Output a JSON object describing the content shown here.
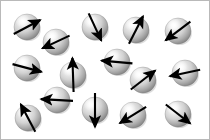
{
  "figure": {
    "type": "diagram",
    "width": 210,
    "height": 140,
    "background_color": "#ffffff",
    "border_color": "#b9b9b9",
    "sphere": {
      "fill_light": "#f2f2f2",
      "fill_mid": "#c9c9c9",
      "fill_dark": "#8d8d8d",
      "edge_color": "#6e6e6e",
      "highlight_color": "#ffffff",
      "shadow_color": "#9a9a9a",
      "default_radius": 13
    },
    "arrow": {
      "color": "#000000",
      "stroke_width": 2.1,
      "head_length": 6.5,
      "head_width": 5.2,
      "default_length": 30
    },
    "legend_text": "",
    "caption": ""
  },
  "chart_data": {
    "type": "scatter",
    "xlabel": "",
    "ylabel": "",
    "xlim": [
      0,
      210
    ],
    "ylim": [
      0,
      140
    ],
    "grid": false,
    "legend": "none",
    "units": "pixels",
    "note": "Each particle is a shaded sphere with a black vector arrow through its center indicating spin direction. Angle is measured in degrees counter-clockwise from the +x axis.",
    "particles": [
      {
        "id": "spin-1",
        "label": "sphere-1",
        "cx": 27,
        "cy": 27,
        "r": 13,
        "angle_deg": 28,
        "length": 30
      },
      {
        "id": "spin-2",
        "label": "sphere-2",
        "cx": 56,
        "cy": 42,
        "r": 13,
        "angle_deg": 205,
        "length": 30
      },
      {
        "id": "spin-3",
        "label": "sphere-3",
        "cx": 95,
        "cy": 27,
        "r": 13,
        "angle_deg": 295,
        "length": 30
      },
      {
        "id": "spin-4",
        "label": "sphere-4",
        "cx": 136,
        "cy": 30,
        "r": 13,
        "angle_deg": 63,
        "length": 31
      },
      {
        "id": "spin-5",
        "label": "sphere-5",
        "cx": 178,
        "cy": 31,
        "r": 13,
        "angle_deg": 217,
        "length": 31
      },
      {
        "id": "spin-6",
        "label": "sphere-6",
        "cx": 27,
        "cy": 68,
        "r": 13,
        "angle_deg": 345,
        "length": 30
      },
      {
        "id": "spin-7",
        "label": "sphere-7",
        "cx": 73,
        "cy": 75,
        "r": 13,
        "angle_deg": 92,
        "length": 34
      },
      {
        "id": "spin-8",
        "label": "sphere-8",
        "cx": 117,
        "cy": 62,
        "r": 13,
        "angle_deg": 175,
        "length": 31
      },
      {
        "id": "spin-9",
        "label": "sphere-9",
        "cx": 143,
        "cy": 80,
        "r": 13,
        "angle_deg": 38,
        "length": 31
      },
      {
        "id": "spin-10",
        "label": "sphere-10",
        "cx": 185,
        "cy": 73,
        "r": 13,
        "angle_deg": 192,
        "length": 31
      },
      {
        "id": "spin-11",
        "label": "sphere-11",
        "cx": 57,
        "cy": 100,
        "r": 13,
        "angle_deg": 177,
        "length": 32
      },
      {
        "id": "spin-12",
        "label": "sphere-12",
        "cx": 28,
        "cy": 118,
        "r": 13,
        "angle_deg": 118,
        "length": 31
      },
      {
        "id": "spin-13",
        "label": "sphere-13",
        "cx": 95,
        "cy": 110,
        "r": 13,
        "angle_deg": 270,
        "length": 34
      },
      {
        "id": "spin-14",
        "label": "sphere-14",
        "cx": 133,
        "cy": 115,
        "r": 13,
        "angle_deg": 212,
        "length": 31
      },
      {
        "id": "spin-15",
        "label": "sphere-15",
        "cx": 178,
        "cy": 114,
        "r": 13,
        "angle_deg": 322,
        "length": 31
      }
    ]
  }
}
